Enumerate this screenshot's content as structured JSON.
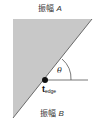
{
  "diagram": {
    "region_a_label": "振幅",
    "region_a_var": "A",
    "region_b_label": "振幅",
    "region_b_var": "B",
    "edge_point_main": "t",
    "edge_point_sub": "edge",
    "angle_label": "θ",
    "colors": {
      "shaded_region": "#c8c8c8",
      "edge_line": "#6a6a6a",
      "point": "#111111"
    }
  }
}
